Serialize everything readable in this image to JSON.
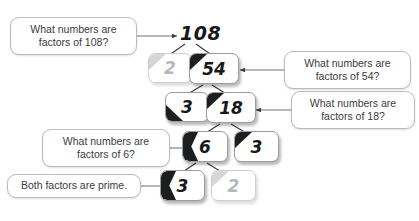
{
  "diagram": {
    "type": "factor-tree",
    "background_color": "#ffffff",
    "line_color": "#3a3a3c",
    "callout_border_color": "#b9bcc0",
    "callout_text_color": "#3b3b3d",
    "node_text_color": "#17181a",
    "node_faded_color": "#b4b8bc",
    "node_accent_color": "#1d1e20"
  },
  "tree": {
    "root": {
      "id": "node-108",
      "value": "108",
      "boxed": false
    },
    "levels": [
      {
        "level": 1,
        "nodes": [
          {
            "id": "node-2-a",
            "value": "2",
            "boxed": true,
            "faded": true,
            "accent": "top-left"
          },
          {
            "id": "node-54",
            "value": "54",
            "boxed": true,
            "faded": false,
            "accent": "top-left"
          }
        ]
      },
      {
        "level": 2,
        "nodes": [
          {
            "id": "node-3-a",
            "value": "3",
            "boxed": true,
            "faded": false,
            "accent": "bottom-left"
          },
          {
            "id": "node-18",
            "value": "18",
            "boxed": true,
            "faded": false,
            "accent": "top-left"
          }
        ]
      },
      {
        "level": 3,
        "nodes": [
          {
            "id": "node-6",
            "value": "6",
            "boxed": true,
            "faded": false,
            "accent": "left"
          },
          {
            "id": "node-3-b",
            "value": "3",
            "boxed": true,
            "faded": false,
            "accent": "top-left"
          }
        ]
      },
      {
        "level": 4,
        "nodes": [
          {
            "id": "node-3-c",
            "value": "3",
            "boxed": true,
            "faded": false,
            "accent": "left"
          },
          {
            "id": "node-2-b",
            "value": "2",
            "boxed": true,
            "faded": true,
            "accent": "top-left"
          }
        ]
      }
    ]
  },
  "callouts": [
    {
      "id": "callout-108",
      "text": "What numbers are\nfactors of 108?",
      "points_to": "node-108",
      "arrow_direction": "right"
    },
    {
      "id": "callout-54",
      "text": "What numbers are\nfactors of 54?",
      "points_to": "node-54",
      "arrow_direction": "left"
    },
    {
      "id": "callout-18",
      "text": "What numbers are\nfactors of 18?",
      "points_to": "node-18",
      "arrow_direction": "left"
    },
    {
      "id": "callout-6",
      "text": "What numbers are\nfactors of 6?",
      "points_to": "node-6",
      "arrow_direction": "right"
    },
    {
      "id": "callout-prime",
      "text": "Both factors are prime.",
      "points_to": "node-3-c",
      "arrow_direction": "right"
    }
  ]
}
